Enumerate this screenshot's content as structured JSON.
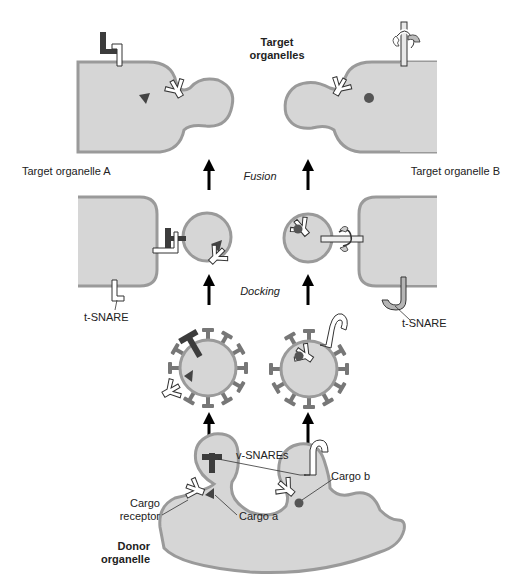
{
  "diagram": {
    "type": "vesicle-trafficking",
    "colors": {
      "organelle_fill": "#d6d6d6",
      "membrane": "#9a9a9a",
      "v_snare_a": "#3c3c3c",
      "coat": "#777777",
      "cargo": "#444444",
      "receptor": "#ffffff",
      "t_snare_b": "#b5b5b5",
      "arrow": "#000000"
    },
    "labels": {
      "target_organelles": "Target\norganelles",
      "target_organelles_line1": "Target",
      "target_organelles_line2": "organelles",
      "target_a": "Target organelle A",
      "target_b": "Target organelle B",
      "fusion": "Fusion",
      "docking": "Docking",
      "t_snare_left": "t-SNARE",
      "t_snare_right": "t-SNARE",
      "v_snares": "v-SNAREs",
      "cargo_b": "Cargo b",
      "cargo_a": "Cargo a",
      "cargo_receptor_line1": "Cargo",
      "cargo_receptor_line2": "receptor",
      "donor_line1": "Donor",
      "donor_line2": "organelle"
    },
    "stages": [
      "Budding from donor organelle",
      "Coated vesicles",
      "Docking",
      "Fusion",
      "Target organelles"
    ]
  }
}
